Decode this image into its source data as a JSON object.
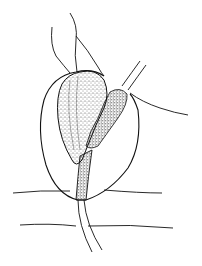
{
  "figure": {
    "kind": "anatomical line drawing with stipple shading",
    "colors": {
      "ink": "#111111",
      "background": "#ffffff",
      "stipple": "#222222"
    },
    "elements": [
      "outer-oval-outline",
      "large-stippled-sac",
      "small-stippled-duct",
      "tube-stem",
      "upper-left-threads",
      "upper-right-paired-tube",
      "right-trailing-thread",
      "horizontal-layer-lines"
    ]
  }
}
